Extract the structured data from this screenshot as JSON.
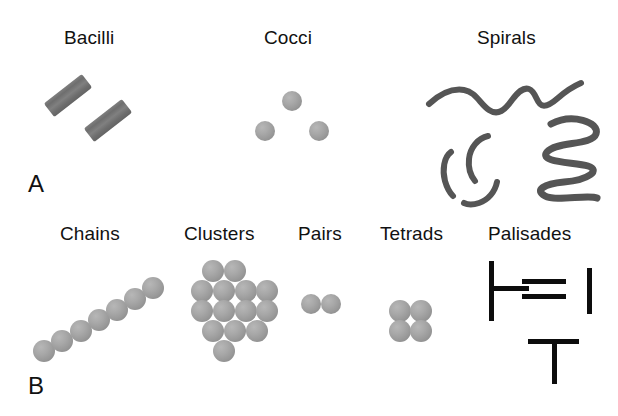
{
  "figure": {
    "background_color": "#ffffff",
    "ink_color": "#111111",
    "cell_color": "#8f8f8f",
    "bar_color": "#0d0d0d",
    "panels": [
      {
        "letter": "A",
        "letter_pos": {
          "x": 28,
          "y": 172
        },
        "groups": [
          {
            "label": "Bacilli",
            "label_pos": {
              "x": 64,
              "y": 28
            },
            "shape": "rods"
          },
          {
            "label": "Cocci",
            "label_pos": {
              "x": 264,
              "y": 28
            },
            "shape": "spheres"
          },
          {
            "label": "Spirals",
            "label_pos": {
              "x": 477,
              "y": 28
            },
            "shape": "spirals"
          }
        ]
      },
      {
        "letter": "B",
        "letter_pos": {
          "x": 28,
          "y": 374
        },
        "groups": [
          {
            "label": "Chains",
            "label_pos": {
              "x": 60,
              "y": 224
            },
            "shape": "sphere-chain"
          },
          {
            "label": "Clusters",
            "label_pos": {
              "x": 184,
              "y": 224
            },
            "shape": "sphere-cluster"
          },
          {
            "label": "Pairs",
            "label_pos": {
              "x": 298,
              "y": 224
            },
            "shape": "sphere-pair"
          },
          {
            "label": "Tetrads",
            "label_pos": {
              "x": 380,
              "y": 224
            },
            "shape": "sphere-tetrad"
          },
          {
            "label": "Palisades",
            "label_pos": {
              "x": 488,
              "y": 224
            },
            "shape": "bars"
          }
        ]
      }
    ],
    "shapes": {
      "bacilli_rods": [
        {
          "x": 44,
          "y": 87,
          "w": 48,
          "h": 17,
          "rotate": -38
        },
        {
          "x": 84,
          "y": 112,
          "w": 48,
          "h": 17,
          "rotate": -38
        }
      ],
      "cocci_spheres": [
        {
          "cx": 292,
          "cy": 101,
          "r": 10
        },
        {
          "cx": 265,
          "cy": 131,
          "r": 10
        },
        {
          "cx": 319,
          "cy": 131,
          "r": 10
        }
      ],
      "chain_spheres": [
        {
          "cx": 44,
          "cy": 351,
          "r": 11
        },
        {
          "cx": 62,
          "cy": 341,
          "r": 11
        },
        {
          "cx": 81,
          "cy": 331,
          "r": 11
        },
        {
          "cx": 99,
          "cy": 320,
          "r": 11
        },
        {
          "cx": 117,
          "cy": 310,
          "r": 11
        },
        {
          "cx": 135,
          "cy": 299,
          "r": 11
        },
        {
          "cx": 153,
          "cy": 288,
          "r": 11
        }
      ],
      "cluster_spheres": [
        {
          "cx": 213,
          "cy": 271,
          "r": 11
        },
        {
          "cx": 235,
          "cy": 271,
          "r": 11
        },
        {
          "cx": 202,
          "cy": 291,
          "r": 11
        },
        {
          "cx": 224,
          "cy": 291,
          "r": 11
        },
        {
          "cx": 246,
          "cy": 291,
          "r": 11
        },
        {
          "cx": 267,
          "cy": 291,
          "r": 11
        },
        {
          "cx": 202,
          "cy": 311,
          "r": 11
        },
        {
          "cx": 224,
          "cy": 311,
          "r": 11
        },
        {
          "cx": 246,
          "cy": 311,
          "r": 11
        },
        {
          "cx": 267,
          "cy": 311,
          "r": 11
        },
        {
          "cx": 213,
          "cy": 331,
          "r": 11
        },
        {
          "cx": 235,
          "cy": 331,
          "r": 11
        },
        {
          "cx": 257,
          "cy": 331,
          "r": 11
        },
        {
          "cx": 224,
          "cy": 351,
          "r": 11
        }
      ],
      "pair_spheres": [
        {
          "cx": 311,
          "cy": 304,
          "r": 10
        },
        {
          "cx": 331,
          "cy": 304,
          "r": 10
        }
      ],
      "tetrad_spheres": [
        {
          "cx": 400,
          "cy": 311,
          "r": 11
        },
        {
          "cx": 421,
          "cy": 311,
          "r": 11
        },
        {
          "cx": 400,
          "cy": 331,
          "r": 11
        },
        {
          "cx": 421,
          "cy": 331,
          "r": 11
        }
      ],
      "spirochete_wave": "M 429,104 C 441,93 452,88 464,90 C 476,92 480,104 489,110 C 498,116 505,110 512,100 C 518,92 523,87 529,89 C 535,91 536,100 540,104 C 544,108 550,105 558,98 C 566,91 574,86 581,83",
      "vibrios": [
        "M 451,152 C 444,157 442,170 445,181 C 447,188 450,193 453,196",
        "M 488,136 C 478,138 470,148 469,159 C 468,168 471,176 475,181",
        "M 497,182 C 495,192 488,200 479,203 C 473,205 468,205 464,203"
      ],
      "spirillum_coil": "M 551,124 C 572,113 600,122 596,134 C 592,146 556,141 547,152 C 538,163 575,162 588,166 C 601,170 589,180 564,182 C 544,184 534,190 545,196 C 556,202 588,194 597,198",
      "palisade_bars": [
        {
          "x": 489,
          "y": 261,
          "w": 5,
          "h": 60,
          "name": "vertical-left"
        },
        {
          "x": 489,
          "y": 286,
          "w": 40,
          "h": 5,
          "name": "horizontal-left"
        },
        {
          "x": 522,
          "y": 279,
          "w": 44,
          "h": 5,
          "name": "horizontal-upper"
        },
        {
          "x": 522,
          "y": 294,
          "w": 44,
          "h": 5,
          "name": "horizontal-lower"
        },
        {
          "x": 587,
          "y": 268,
          "w": 5,
          "h": 46,
          "name": "vertical-right"
        },
        {
          "x": 528,
          "y": 339,
          "w": 51,
          "h": 5,
          "name": "horizontal-tee"
        },
        {
          "x": 552,
          "y": 339,
          "w": 5,
          "h": 45,
          "name": "vertical-tee"
        }
      ]
    }
  }
}
